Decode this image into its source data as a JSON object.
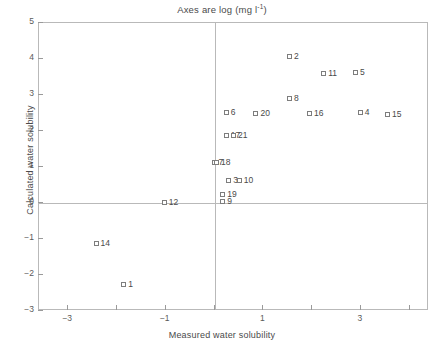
{
  "chart_data": {
    "type": "scatter",
    "title": "Axes are log (mg l",
    "title_sup": "-1",
    "title_tail": ")",
    "title_full": "Axes are log (mg l-1)",
    "xlabel": "Measured water solubility",
    "ylabel": "Calculated water solubility",
    "xlim": [
      -3.6,
      4.4
    ],
    "ylim": [
      -3,
      5
    ],
    "xticks": [
      -3,
      -2,
      -1,
      0,
      1,
      2,
      3,
      4
    ],
    "xticklabels": [
      "-3",
      "",
      "-1",
      "",
      "1",
      "",
      "3",
      ""
    ],
    "yticks": [
      5,
      4,
      3,
      2,
      1,
      0,
      -1,
      -2,
      -3
    ],
    "yticklabels": [
      "5",
      "4",
      "3",
      "2",
      "1",
      "0",
      "-1",
      "-2",
      "-3"
    ],
    "grid": false,
    "legend": null,
    "marker": "open-square",
    "reference_lines": {
      "vertical_x": 0,
      "horizontal_y": 0
    },
    "points": [
      {
        "label": "2",
        "x": 1.55,
        "y": 4.05
      },
      {
        "label": "11",
        "x": 2.25,
        "y": 3.58
      },
      {
        "label": "5",
        "x": 2.9,
        "y": 3.62
      },
      {
        "label": "8",
        "x": 1.55,
        "y": 2.9
      },
      {
        "label": "6",
        "x": 0.25,
        "y": 2.5
      },
      {
        "label": "20",
        "x": 0.86,
        "y": 2.48
      },
      {
        "label": "16",
        "x": 1.96,
        "y": 2.47
      },
      {
        "label": "4",
        "x": 3.0,
        "y": 2.5
      },
      {
        "label": "15",
        "x": 3.56,
        "y": 2.45
      },
      {
        "label": "17",
        "x": 0.25,
        "y": 1.85
      },
      {
        "label": "21",
        "x": 0.4,
        "y": 1.85
      },
      {
        "label": "7",
        "x": 0.0,
        "y": 1.1
      },
      {
        "label": "18",
        "x": 0.05,
        "y": 1.1
      },
      {
        "label": "3",
        "x": 0.3,
        "y": 0.62
      },
      {
        "label": "10",
        "x": 0.52,
        "y": 0.62
      },
      {
        "label": "19",
        "x": 0.18,
        "y": 0.22
      },
      {
        "label": "9",
        "x": 0.18,
        "y": 0.02
      },
      {
        "label": "12",
        "x": -1.02,
        "y": 0.0
      },
      {
        "label": "14",
        "x": -2.42,
        "y": -1.15
      },
      {
        "label": "1",
        "x": -1.85,
        "y": -2.28
      }
    ]
  }
}
